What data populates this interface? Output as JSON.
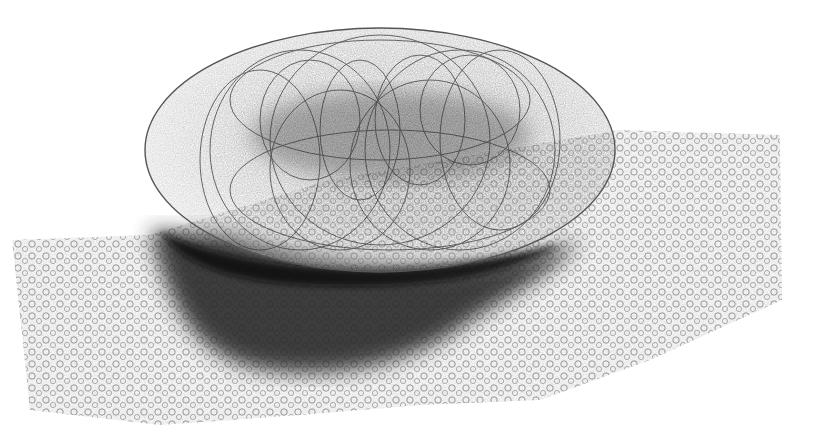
{
  "image": {
    "subject": "pencil sketch of an egg-shaped scribble-shaded object on a textured surface",
    "colors": {
      "paper": "#ffffff",
      "graphite_dark": "#1e1e1e",
      "graphite_mid": "#555555",
      "graphite_light": "#9a9a9a"
    }
  }
}
